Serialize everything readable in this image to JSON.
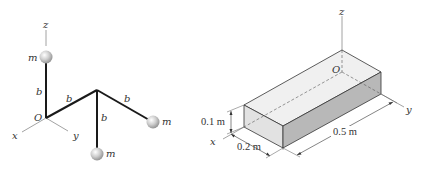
{
  "left_figure": {
    "axes": {
      "z": "z",
      "x": "x",
      "y": "y",
      "origin": "O"
    },
    "masses": [
      "m",
      "m",
      "m"
    ],
    "rod_labels": [
      "b",
      "b",
      "b",
      "b"
    ],
    "colors": {
      "rod": "#1a1a1a",
      "axis": "#8a8a8a",
      "ball": "#c8c8c8"
    }
  },
  "right_figure": {
    "axes": {
      "z": "z",
      "x": "x",
      "y": "y",
      "origin": "O"
    },
    "dimensions": {
      "height": "0.1 m",
      "width": "0.2 m",
      "length": "0.5 m"
    },
    "colors": {
      "top_face": "#f0f0f0",
      "front_face": "#e2e2e2",
      "side_face": "#b8b8b8",
      "edge": "#333333"
    }
  }
}
